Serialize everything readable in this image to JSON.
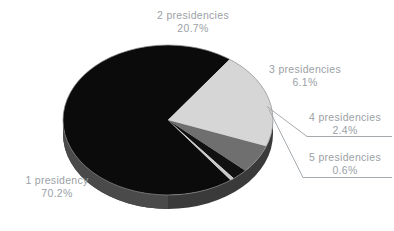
{
  "chart_data": {
    "type": "pie",
    "title": "",
    "subtitle": "",
    "xlabel": "",
    "ylabel": "",
    "legend_position": "none",
    "grid": false,
    "three_d": true,
    "categories": [
      "1 presidency",
      "2 presidencies",
      "3 presidencies",
      "4 presidencies",
      "5 presidencies"
    ],
    "values": [
      70.2,
      20.7,
      6.1,
      2.4,
      0.6
    ],
    "value_suffix": "%",
    "slices": [
      {
        "label": "1 presidency",
        "value": 70.2,
        "value_text": "70.2%",
        "color": "#0b0b0b",
        "side_color": "#3a3a3a",
        "leader": false
      },
      {
        "label": "2 presidencies",
        "value": 20.7,
        "value_text": "20.7%",
        "color": "#d6d6d6",
        "side_color": "#a8a8a8",
        "leader": false
      },
      {
        "label": "3 presidencies",
        "value": 6.1,
        "value_text": "6.1%",
        "color": "#6f6f6f",
        "side_color": "#4a4a4a",
        "leader": false
      },
      {
        "label": "4 presidencies",
        "value": 2.4,
        "value_text": "2.4%",
        "color": "#111111",
        "side_color": "#2e2e2e",
        "leader": true
      },
      {
        "label": "5 presidencies",
        "value": 0.6,
        "value_text": "0.6%",
        "color": "#c9c9c9",
        "side_color": "#9d9d9d",
        "leader": true
      }
    ],
    "colors": {
      "slice_1": "#0b0b0b",
      "slice_2": "#d6d6d6",
      "slice_3": "#6f6f6f",
      "slice_4": "#111111",
      "slice_5": "#c9c9c9",
      "label_text": "#9ba1a5",
      "leader_line": "#9ba1a5",
      "background": "#ffffff"
    }
  },
  "labels": {
    "s1": {
      "name": "1 presidency",
      "pct": "70.2%"
    },
    "s2": {
      "name": "2 presidencies",
      "pct": "20.7%"
    },
    "s3": {
      "name": "3 presidencies",
      "pct": "6.1%"
    },
    "s4": {
      "name": "4 presidencies",
      "pct": "2.4%"
    },
    "s5": {
      "name": "5 presidencies",
      "pct": "0.6%"
    }
  }
}
